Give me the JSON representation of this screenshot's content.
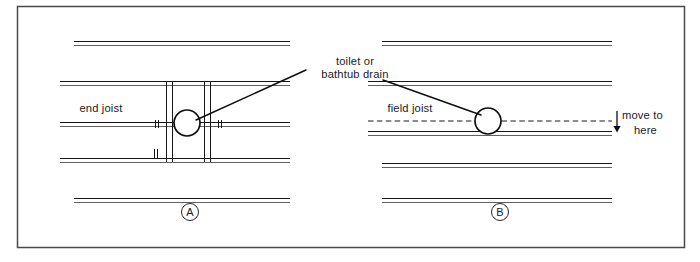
{
  "figure": {
    "kind": "construction-detail-diagram",
    "title_visible": false,
    "background_color": "#ffffff",
    "ink_color": "#171717",
    "frame": {
      "x": 17,
      "y": 6,
      "width": 668,
      "height": 242
    }
  },
  "labels": {
    "end_joist": "end joist",
    "field_joist": "field joist",
    "drain_line_1": "toilet or",
    "drain_line_2": "bathtub drain",
    "move_to_line_1": "move to",
    "move_to_line_2": "here",
    "panel_a_letter": "A",
    "panel_b_letter": "B"
  },
  "panels": [
    {
      "id": "A",
      "letter": "A",
      "letter_center": {
        "x": 190,
        "y": 212
      },
      "description_label": "end joist",
      "label_position": {
        "x": 101,
        "y": 112
      },
      "joists": [
        {
          "y": 43,
          "x1": 74,
          "x2": 290
        },
        {
          "y": 83,
          "x1": 60,
          "x2": 290
        },
        {
          "y": 124,
          "x1": 60,
          "x2": 290
        },
        {
          "y": 160,
          "x1": 60,
          "x2": 290
        },
        {
          "y": 200,
          "x1": 74,
          "x2": 290
        }
      ],
      "headers": [
        {
          "x": 166,
          "y1": 83,
          "y2": 160
        },
        {
          "x": 172,
          "y1": 83,
          "y2": 160
        },
        {
          "x": 204,
          "y1": 83,
          "y2": 160
        },
        {
          "x": 210,
          "y1": 83,
          "y2": 160
        }
      ],
      "drain_circle": {
        "cx": 187,
        "cy": 123,
        "r": 13
      },
      "tick_marks": [
        {
          "x": 157,
          "y": 124
        },
        {
          "x": 219,
          "y": 124
        },
        {
          "x": 156,
          "y": 155
        }
      ]
    },
    {
      "id": "B",
      "letter": "B",
      "letter_center": {
        "x": 500,
        "y": 212
      },
      "description_label": "field joist",
      "label_position": {
        "x": 410,
        "y": 112
      },
      "joists": [
        {
          "y": 43,
          "x1": 382,
          "x2": 612
        },
        {
          "y": 83,
          "x1": 368,
          "x2": 612
        },
        {
          "y": 132,
          "x1": 368,
          "x2": 612
        },
        {
          "y": 165,
          "x1": 382,
          "x2": 612
        },
        {
          "y": 200,
          "x1": 382,
          "x2": 612
        }
      ],
      "dashed_joist": {
        "y": 121,
        "x1": 368,
        "x2": 612
      },
      "drain_circle": {
        "cx": 488,
        "cy": 121,
        "r": 13
      },
      "move_arrow": {
        "x": 617,
        "y_from": 113,
        "y_to": 131
      }
    }
  ],
  "leaders": [
    {
      "name": "leader-to-drain-a",
      "x1": 196,
      "y1": 120,
      "x2": 306,
      "y2": 70
    },
    {
      "name": "leader-to-drain-b",
      "x1": 383,
      "y1": 80,
      "x2": 481,
      "y2": 115
    }
  ],
  "callout": {
    "text_x": 355,
    "line1_y": 65,
    "line2_y": 78
  }
}
